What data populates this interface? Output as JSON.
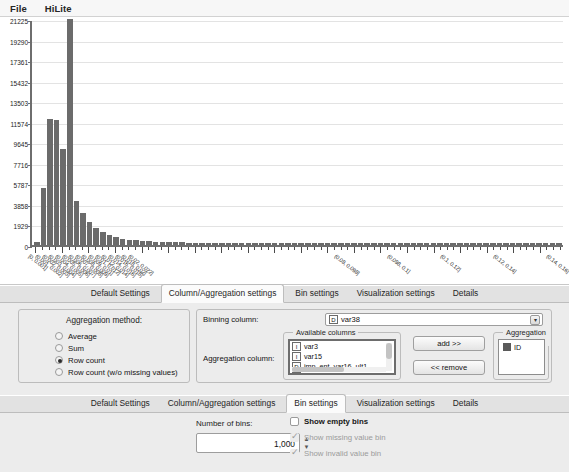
{
  "menubar": {
    "items": [
      {
        "label": "File"
      },
      {
        "label": "HiLite"
      }
    ]
  },
  "chart_data": {
    "type": "bar",
    "title": "",
    "xlabel": "",
    "ylabel": "",
    "ylim": [
      0,
      21225
    ],
    "grid": true,
    "legend": "none",
    "ytick_labels": [
      "21225",
      "19290",
      "17361",
      "15432",
      "13503",
      "11574",
      "9645",
      "7716",
      "5787",
      "3858",
      "1929",
      "0"
    ],
    "ytick_values": [
      21225,
      19290,
      17361,
      15432,
      13503,
      11574,
      9645,
      7716,
      5787,
      3858,
      1929,
      0
    ],
    "categories": [
      "[0, 0.001]",
      "(0.001, 0.002]",
      "(0.002, 0.003]",
      "(0.003, 0.004]",
      "(0.004, 0.005]",
      "(0.005, 0.006]",
      "(0.006, 0.007]",
      "(0.007, 0.008]",
      "(0.008, 0.009]",
      "(0.009, 0.01]",
      "(0.01, 0.012]",
      "(0.012, 0.014]",
      "(0.014, 0.016]",
      "(0.016, 0.018]",
      "(0.018, 0.02]",
      "(0.02, 0.022]",
      "(0.022, 0.024]",
      "(0.024, 0.026]",
      "(0.026, 0.028]",
      "(0.028, 0.03]",
      "(0.03, 0.032]",
      "(0.032, 0.034]",
      "(0.034, 0.036]",
      "(0.036, 0.038]",
      "(0.038, 0.04]",
      "(0.04, 0.042]",
      "(0.042, 0.044]",
      "(0.044, 0.046]",
      "(0.046, 0.048]",
      "(0.048, 0.05]",
      "(0.05, 0.052]",
      "(0.052, 0.054]",
      "(0.054, 0.056]",
      "(0.056, 0.058]",
      "(0.058, 0.06]",
      "(0.06, 0.062]",
      "(0.062, 0.064]",
      "(0.064, 0.066]",
      "(0.066, 0.068]",
      "(0.068, 0.07]",
      "(0.07, 0.072]",
      "(0.072, 0.074]",
      "(0.074, 0.076]",
      "(0.076, 0.078]",
      "(0.078, 0.08]",
      "(0.08, 0.082]",
      "(0.082, 0.084]",
      "(0.084, 0.086]",
      "(0.086, 0.088]",
      "(0.088, 0.09]",
      "(0.09, 0.092]",
      "(0.092, 0.094]",
      "(0.094, 0.096]",
      "(0.096, 0.098]",
      "(0.098, 0.1]",
      "(0.1, 0.102]",
      "(0.102, 0.104]",
      "(0.104, 0.106]",
      "(0.106, 0.108]",
      "(0.108, 0.11]",
      "(0.11, 0.112]",
      "(0.112, 0.114]",
      "(0.114, 0.116]",
      "(0.116, 0.118]",
      "(0.118, 0.12]",
      "(0.12, 0.122]",
      "(0.122, 0.124]",
      "(0.124, 0.126]",
      "(0.126, 0.128]",
      "(0.128, 0.13]",
      "(0.13, 0.132]",
      "(0.132, 0.134]",
      "(0.134, 0.136]",
      "(0.136, 0.138]",
      "(0.138, 0.14]",
      "(0.14, 0.142]",
      "(0.142, 0.144]",
      "(0.144, 0.146]",
      "(0.146, 0.148]",
      "(0.148, 0.15]"
    ],
    "values": [
      320,
      5400,
      11800,
      11750,
      9050,
      21225,
      4150,
      3050,
      2150,
      1600,
      1180,
      900,
      720,
      600,
      500,
      430,
      380,
      340,
      300,
      280,
      260,
      250,
      240,
      235,
      230,
      225,
      220,
      215,
      212,
      210,
      208,
      205,
      203,
      200,
      198,
      196,
      195,
      193,
      192,
      190,
      189,
      188,
      187,
      186,
      185,
      184,
      183,
      182,
      181,
      180,
      179,
      178,
      177,
      176,
      175,
      174,
      173,
      172,
      171,
      170,
      169,
      168,
      167,
      166,
      165,
      164,
      163,
      162,
      161,
      160,
      159,
      158,
      157,
      156,
      155,
      154,
      153,
      152,
      151,
      150
    ],
    "visible_xtick_labels": [
      "[0, 0.001]",
      "(0.001, 0.002]",
      "(0.002, 0.003]",
      "(0.003, 0.004]",
      "(0.004, 0.005]",
      "(0.005, 0.006]",
      "(0.006, 0.007]",
      "(0.007, 0.008]",
      "(0.008, 0.009]",
      "(0.009, 0.01]",
      "(0.01, 0.012]",
      "(0.012, 0.014]",
      "(0.014, 0.016]",
      "(0.016, 0.018]",
      "(0.018, 0.02]",
      "(0.02, 0.022]",
      "(0.08, 0.098]",
      "(0.098, 0.1]",
      "(0.1, 0.12]",
      "(0.12, 0.14]",
      "(0.14, 0.16]"
    ]
  },
  "column_section": {
    "tabs": [
      {
        "label": "Default Settings",
        "selected": false
      },
      {
        "label": "Column/Aggregation settings",
        "selected": true
      },
      {
        "label": "Bin settings",
        "selected": false
      },
      {
        "label": "Visualization settings",
        "selected": false
      },
      {
        "label": "Details",
        "selected": false
      }
    ],
    "aggregation_method": {
      "heading": "Aggregation method:",
      "options": [
        {
          "label": "Average",
          "checked": false
        },
        {
          "label": "Sum",
          "checked": false
        },
        {
          "label": "Row count",
          "checked": true
        },
        {
          "label": "Row count (w/o missing values)",
          "checked": false
        }
      ]
    },
    "binning_column": {
      "label": "Binning column:",
      "type_badge": "D",
      "value": "var38"
    },
    "aggregation_column": {
      "label": "Aggregation column:",
      "available_title": "Available columns",
      "available_items": [
        {
          "badge": "I",
          "name": "var3"
        },
        {
          "badge": "I",
          "name": "var15"
        },
        {
          "badge": "D",
          "name": "imp_ent_var16_ult1"
        },
        {
          "badge": "D",
          "name": "imp_op_var39_com"
        }
      ],
      "add_label": "add >>",
      "remove_label": "<< remove",
      "aggregation_title": "Aggregation columns",
      "aggregation_items": [
        {
          "name": "ID"
        }
      ]
    }
  },
  "bin_section": {
    "tabs": [
      {
        "label": "Default Settings",
        "selected": false
      },
      {
        "label": "Column/Aggregation settings",
        "selected": false
      },
      {
        "label": "Bin settings",
        "selected": true
      },
      {
        "label": "Visualization settings",
        "selected": false
      },
      {
        "label": "Details",
        "selected": false
      }
    ],
    "number_of_bins_label": "Number of bins:",
    "number_of_bins_value": "1,000",
    "checkboxes": [
      {
        "label": "Show empty bins",
        "checked": false,
        "disabled": false
      },
      {
        "label": "Show missing value bin",
        "checked": true,
        "disabled": true
      },
      {
        "label": "Show invalid value bin",
        "checked": true,
        "disabled": true
      }
    ]
  },
  "colors": {
    "bar": "#6b6b6b",
    "panel": "#ececec",
    "axis": "#6e6e6e",
    "grid": "#e3e3e3"
  }
}
